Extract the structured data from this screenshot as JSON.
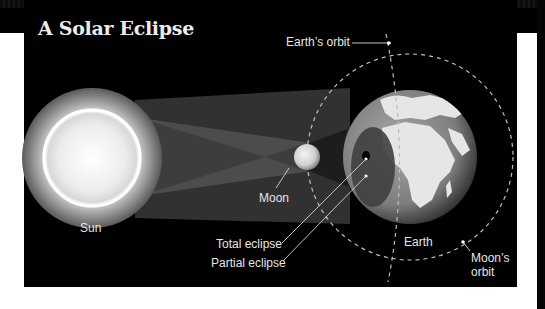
{
  "title": "A Solar Eclipse",
  "labels": {
    "earths_orbit": "Earth’s orbit",
    "sun": "Sun",
    "moon": "Moon",
    "total_eclipse": "Total eclipse",
    "partial_eclipse": "Partial eclipse",
    "earth": "Earth",
    "moons_orbit_line1": "Moon’s",
    "moons_orbit_line2": "orbit"
  },
  "colors": {
    "background": "#000000",
    "title": "#ececec",
    "label": "#e6e6e6",
    "sun_core": "#ffffff",
    "earth_land": "#e8e8e8",
    "earth_sea": "#8a8a8a",
    "orbit_dash": "#bdbdbd"
  },
  "bodies": {
    "sun": {
      "cx": 92,
      "cy": 158,
      "r": 48,
      "glow_r": 70
    },
    "moon": {
      "cx": 307,
      "cy": 157,
      "r": 13
    },
    "earth": {
      "cx": 410,
      "cy": 157,
      "r": 67
    }
  }
}
